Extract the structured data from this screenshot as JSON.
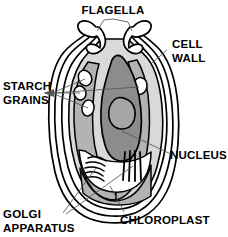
{
  "diagram": {
    "background_color": "#ffffff",
    "ink_color": "#000000",
    "leader_line_color": "#555555",
    "palette": {
      "cytoplasm": "#d9d9d9",
      "chloroplast": "#b3b3b3",
      "nucleus": "#8c8c8c",
      "nucleolus": "#a6a6a6",
      "starch_grain": "#ffffff",
      "cell_wall_gap": "#ffffff"
    },
    "labels": [
      {
        "id": "flagella",
        "name": "FLAGELLA",
        "lines": [
          "FLAGELLA"
        ],
        "position": "top-center"
      },
      {
        "id": "cell-wall",
        "name": "CELL WALL",
        "lines": [
          "CELL",
          "WALL"
        ],
        "position": "top-right"
      },
      {
        "id": "starch-grains",
        "name": "STARCH GRAINS",
        "lines": [
          "STARCH",
          "GRAINS"
        ],
        "position": "middle-left"
      },
      {
        "id": "nucleus",
        "name": "NUCLEUS",
        "lines": [
          "NUCLEUS"
        ],
        "position": "middle-right"
      },
      {
        "id": "golgi-apparatus",
        "name": "GOLGI APPARATUS",
        "lines": [
          "GOLGI",
          "APPARATUS"
        ],
        "position": "bottom-left"
      },
      {
        "id": "chloroplast",
        "name": "CHLOROPLAST",
        "lines": [
          "CHLOROPLAST"
        ],
        "position": "bottom-right"
      }
    ],
    "structures": [
      {
        "id": "flagellum-left",
        "name": "left flagellum"
      },
      {
        "id": "flagellum-right",
        "name": "right flagellum"
      },
      {
        "id": "cell-wall-layers",
        "name": "cell wall layers",
        "layer_count": 3
      },
      {
        "id": "chloroplast-body",
        "name": "chloroplast"
      },
      {
        "id": "starch-grain-1",
        "name": "starch grain"
      },
      {
        "id": "starch-grain-2",
        "name": "starch grain"
      },
      {
        "id": "starch-grain-3",
        "name": "starch grain"
      },
      {
        "id": "starch-grain-4",
        "name": "starch grain"
      },
      {
        "id": "nucleus-body",
        "name": "nucleus"
      },
      {
        "id": "nucleolus",
        "name": "nucleolus"
      },
      {
        "id": "golgi-stack-left",
        "name": "golgi cisternae (curved)"
      },
      {
        "id": "golgi-stack-right",
        "name": "golgi cisternae (straight)"
      }
    ]
  }
}
